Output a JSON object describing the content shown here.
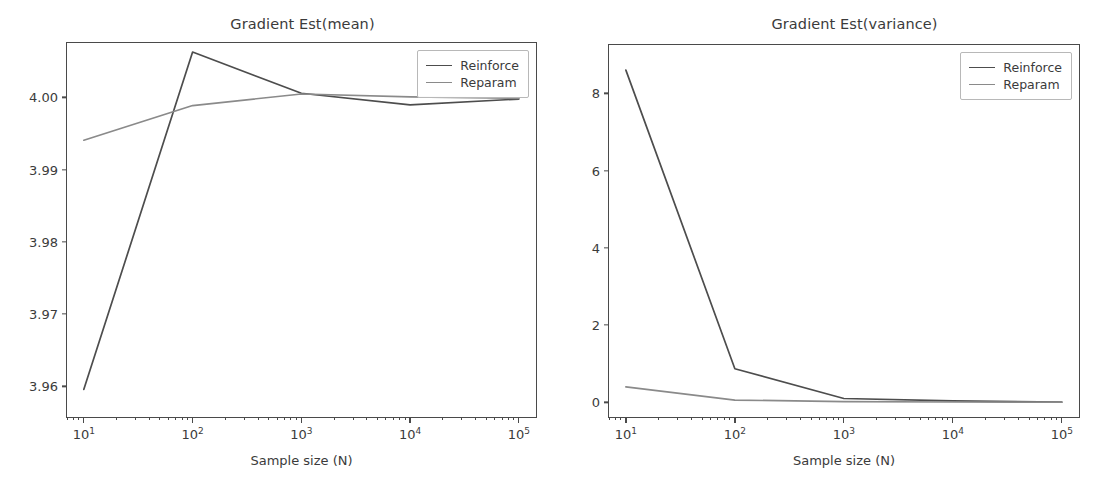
{
  "figure": {
    "width": 1110,
    "height": 492,
    "background": "#ffffff",
    "xlabel": "Sample size (N)"
  },
  "colors": {
    "reinforce": "#4d4d4d",
    "reparam": "#8a8a8a",
    "axis": "#4a4a4a",
    "text": "#3b3b3b"
  },
  "legend": {
    "entries": [
      "Reinforce",
      "Reparam"
    ]
  },
  "xticks": {
    "labels": [
      "10",
      "10",
      "10",
      "10",
      "10"
    ],
    "exponents": [
      "1",
      "2",
      "3",
      "4",
      "5"
    ],
    "values": [
      10,
      100,
      1000,
      10000,
      100000
    ]
  },
  "chart_data": [
    {
      "type": "line",
      "title": "Gradient Est(mean)",
      "xlabel": "Sample size (N)",
      "ylabel": "",
      "xscale": "log",
      "xlim": [
        7.0,
        150000
      ],
      "ylim": [
        3.9555,
        4.0075
      ],
      "yticks": [
        3.96,
        3.97,
        3.98,
        3.99,
        4.0
      ],
      "ytick_labels": [
        "3.96",
        "3.97",
        "3.98",
        "3.99",
        "4.00"
      ],
      "grid": false,
      "legend_position": "upper right",
      "x": [
        10,
        100,
        1000,
        10000,
        100000
      ],
      "series": [
        {
          "name": "Reinforce",
          "color": "#4d4d4d",
          "values": [
            3.9596,
            4.00625,
            4.00055,
            3.99895,
            3.99975
          ]
        },
        {
          "name": "Reparam",
          "color": "#8a8a8a",
          "values": [
            3.99405,
            3.99885,
            4.00045,
            4.00005,
            3.99985
          ]
        }
      ]
    },
    {
      "type": "line",
      "title": "Gradient Est(variance)",
      "xlabel": "Sample size (N)",
      "ylabel": "",
      "xscale": "log",
      "xlim": [
        7.0,
        150000
      ],
      "ylim": [
        -0.43,
        9.25
      ],
      "yticks": [
        0,
        2,
        4,
        6,
        8
      ],
      "ytick_labels": [
        "0",
        "2",
        "4",
        "6",
        "8"
      ],
      "grid": false,
      "legend_position": "upper right",
      "x": [
        10,
        100,
        1000,
        10000,
        100000
      ],
      "series": [
        {
          "name": "Reinforce",
          "color": "#4d4d4d",
          "values": [
            8.6,
            0.87,
            0.1,
            0.04,
            0.01
          ]
        },
        {
          "name": "Reparam",
          "color": "#8a8a8a",
          "values": [
            0.4,
            0.06,
            0.02,
            0.01,
            0.005
          ]
        }
      ]
    }
  ]
}
